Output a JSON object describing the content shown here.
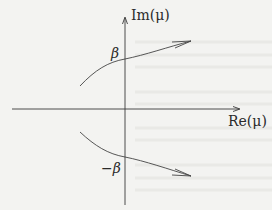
{
  "figure": {
    "type": "complex-plane-diagram",
    "axes": {
      "horizontal_label": "Re(μ)",
      "vertical_label": "Im(μ)"
    },
    "markers": {
      "upper": "β",
      "lower": "−β"
    },
    "curves": [
      {
        "name": "upper-branch",
        "direction": "left-to-right",
        "crosses_imaginary_axis_at": "β"
      },
      {
        "name": "lower-branch",
        "direction": "left-to-right",
        "crosses_imaginary_axis_at": "−β"
      }
    ],
    "colors": {
      "ink": "#3a3a3a",
      "paper": "#f3f3f1"
    }
  }
}
